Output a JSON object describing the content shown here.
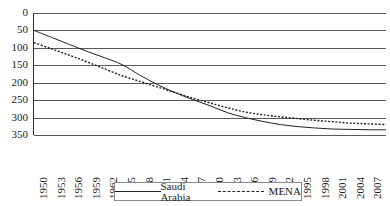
{
  "chart_data": {
    "type": "line",
    "title": "",
    "xlabel": "",
    "ylabel": "",
    "grid": true,
    "legend_position": "bottom",
    "y_inverted": true,
    "ylim": [
      0,
      350
    ],
    "yticks": [
      0,
      50,
      100,
      150,
      200,
      250,
      300,
      350
    ],
    "xlim": [
      1950,
      2010
    ],
    "categories": [
      "1950",
      "1953",
      "1956",
      "1959",
      "1962",
      "1965",
      "1968",
      "1971",
      "1974",
      "1977",
      "1980",
      "1983",
      "1986",
      "1989",
      "1992",
      "1995",
      "1998",
      "2001",
      "2004",
      "2007",
      "2010"
    ],
    "series": [
      {
        "name": "Saudi Arabia",
        "style": "solid",
        "color": "#222222",
        "values": [
          50,
          70,
          90,
          110,
          128,
          148,
          178,
          205,
          228,
          248,
          266,
          286,
          300,
          311,
          320,
          326,
          330,
          333,
          334,
          335,
          335
        ]
      },
      {
        "name": "MENA",
        "style": "dashed",
        "color": "#222222",
        "values": [
          85,
          103,
          121,
          140,
          160,
          180,
          196,
          212,
          228,
          244,
          258,
          272,
          284,
          292,
          298,
          303,
          308,
          312,
          316,
          318,
          320
        ]
      }
    ]
  },
  "legend": {
    "entries": [
      {
        "label": "Saudi Arabia",
        "style": "solid"
      },
      {
        "label": "MENA",
        "style": "dashed"
      }
    ]
  },
  "colors": {
    "line": "#222222",
    "grid": "#595959",
    "axis": "#2b2b2b",
    "text": "#1a1a1a",
    "background": "#ffffff"
  }
}
